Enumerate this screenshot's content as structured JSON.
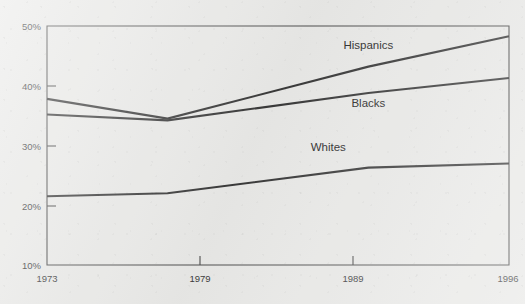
{
  "chart_data": {
    "type": "line",
    "title": "",
    "subtitle": "",
    "xlabel": "",
    "ylabel": "",
    "x": [
      1973,
      1979,
      1989,
      1996
    ],
    "xtick_labels": [
      "1973",
      "1979",
      "1989",
      "1996"
    ],
    "xlim": [
      1973,
      1996
    ],
    "ylim": [
      10,
      50
    ],
    "ytick_values": [
      10,
      20,
      30,
      40,
      50
    ],
    "ytick_labels": [
      "10%",
      "20%",
      "30%",
      "40%",
      "50%"
    ],
    "grid": false,
    "legend_position": "inline-labels",
    "series": [
      {
        "name": "Hispanics",
        "label": "Hispanics",
        "values": [
          37.8,
          34.5,
          43.2,
          48.3
        ],
        "label_x": 1989,
        "label_y": 46.2
      },
      {
        "name": "Blacks",
        "label": "Blacks",
        "values": [
          35.2,
          34.2,
          38.8,
          41.3
        ],
        "label_x": 1989,
        "label_y": 36.4
      },
      {
        "name": "Whites",
        "label": "Whites",
        "values": [
          21.5,
          22.0,
          26.3,
          27.0
        ],
        "label_x": 1987,
        "label_y": 29.1
      }
    ],
    "colors": {
      "line": "#3a3a3a",
      "axis": "#4f4f4f",
      "text": "#3c3c3c",
      "background": "#e9e9e7"
    }
  },
  "axis": {
    "y_labels": [
      "50%",
      "40%",
      "30%",
      "20%",
      "10%"
    ],
    "x_labels": [
      "1973",
      "1979",
      "1989",
      "1996"
    ]
  },
  "labels": {
    "hispanics": "Hispanics",
    "blacks": "Blacks",
    "whites": "Whites"
  }
}
